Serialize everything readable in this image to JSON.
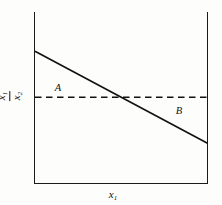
{
  "chart_data": {
    "type": "line",
    "title": "",
    "xlabel": "x1",
    "ylabel": "x1/x2",
    "grid": false,
    "legend": null,
    "axis_frame": "left-right-bottom",
    "xlim": [
      0,
      1
    ],
    "ylim": [
      0,
      1
    ],
    "series": [
      {
        "name": "demand-curve",
        "style": "solid",
        "color": "#111111",
        "x": [
          0,
          1
        ],
        "y": [
          0.77,
          0.23
        ],
        "points": [
          {
            "x": 0,
            "y": 0.77
          },
          {
            "x": 1,
            "y": 0.23
          }
        ]
      },
      {
        "name": "equilibrium-ratio-line",
        "style": "dashed",
        "color": "#111111",
        "x": [
          0,
          1
        ],
        "y": [
          0.5,
          0.5
        ],
        "points": [
          {
            "x": 0,
            "y": 0.5
          },
          {
            "x": 1,
            "y": 0.5
          }
        ]
      }
    ],
    "intersection": {
      "x": 0.5,
      "y": 0.5
    },
    "annotations": [
      {
        "text": "A",
        "x": 0.14,
        "y": 0.55,
        "style": "italic"
      },
      {
        "text": "B",
        "x": 0.84,
        "y": 0.42,
        "style": "italic"
      }
    ]
  },
  "labels": {
    "y_axis_numerator": "x",
    "y_axis_numerator_sub": "1",
    "y_axis_denominator": "x",
    "y_axis_denominator_sub": "2",
    "x_axis": "x",
    "x_axis_sub": "1",
    "region_a": "A",
    "region_b": "B"
  },
  "colors": {
    "ink": "#111111",
    "axis": "#1a1a1a",
    "background": "#fdfdfb"
  }
}
